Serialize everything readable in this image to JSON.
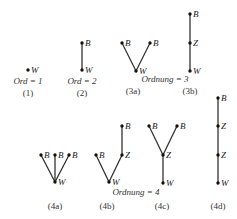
{
  "figure": {
    "labels": {
      "bottom": "B",
      "middle": "Z",
      "top_root": "W"
    },
    "order_labels": [
      {
        "id": "ord1",
        "text": "Ord = 1",
        "x": 28,
        "y": 84
      },
      {
        "id": "ord2",
        "text": "Ord = 2",
        "x": 82,
        "y": 84
      },
      {
        "id": "ord3",
        "text": "Ordnung  = 3",
        "x": 165,
        "y": 82
      },
      {
        "id": "ord4",
        "text": "Ordnung  = 4",
        "x": 136,
        "y": 195
      }
    ],
    "captions": [
      {
        "id": "c1",
        "text": "(1)",
        "x": 28,
        "y": 96
      },
      {
        "id": "c2",
        "text": "(2)",
        "x": 82,
        "y": 96
      },
      {
        "id": "c3a",
        "text": "(3a)",
        "x": 133,
        "y": 94
      },
      {
        "id": "c3b",
        "text": "(3b)",
        "x": 190,
        "y": 94
      },
      {
        "id": "c4a",
        "text": "(4a)",
        "x": 55,
        "y": 209
      },
      {
        "id": "c4b",
        "text": "(4b)",
        "x": 107,
        "y": 209
      },
      {
        "id": "c4c",
        "text": "(4c)",
        "x": 162,
        "y": 209
      },
      {
        "id": "c4d",
        "text": "(4d)",
        "x": 218,
        "y": 209
      }
    ],
    "trees": [
      {
        "id": "tree-1",
        "nodes": [
          {
            "x": 28,
            "y": 70,
            "label": "W"
          }
        ],
        "edges": []
      },
      {
        "id": "tree-2",
        "nodes": [
          {
            "x": 82,
            "y": 43,
            "label": "B"
          },
          {
            "x": 82,
            "y": 70,
            "label": "W"
          }
        ],
        "edges": [
          [
            0,
            1
          ]
        ]
      },
      {
        "id": "tree-3a",
        "nodes": [
          {
            "x": 122,
            "y": 43,
            "label": "B"
          },
          {
            "x": 150,
            "y": 43,
            "label": "B"
          },
          {
            "x": 136,
            "y": 71,
            "label": "W"
          }
        ],
        "edges": [
          [
            0,
            2
          ],
          [
            1,
            2
          ]
        ]
      },
      {
        "id": "tree-3b",
        "nodes": [
          {
            "x": 190,
            "y": 14,
            "label": "B"
          },
          {
            "x": 190,
            "y": 43,
            "label": "Z"
          },
          {
            "x": 190,
            "y": 71,
            "label": "W"
          }
        ],
        "edges": [
          [
            0,
            1
          ],
          [
            1,
            2
          ]
        ]
      },
      {
        "id": "tree-4a",
        "nodes": [
          {
            "x": 41,
            "y": 155,
            "label": "B"
          },
          {
            "x": 55,
            "y": 155,
            "label": "B"
          },
          {
            "x": 69,
            "y": 155,
            "label": "B"
          },
          {
            "x": 55,
            "y": 182,
            "label": "W"
          }
        ],
        "edges": [
          [
            0,
            3
          ],
          [
            1,
            3
          ],
          [
            2,
            3
          ]
        ]
      },
      {
        "id": "tree-4b",
        "nodes": [
          {
            "x": 96,
            "y": 155,
            "label": "B"
          },
          {
            "x": 122,
            "y": 126,
            "label": "B"
          },
          {
            "x": 122,
            "y": 155,
            "label": "Z"
          },
          {
            "x": 109,
            "y": 182,
            "label": "W"
          }
        ],
        "edges": [
          [
            0,
            3
          ],
          [
            1,
            2
          ],
          [
            2,
            3
          ]
        ]
      },
      {
        "id": "tree-4c",
        "nodes": [
          {
            "x": 149,
            "y": 126,
            "label": "B"
          },
          {
            "x": 177,
            "y": 126,
            "label": "B"
          },
          {
            "x": 163,
            "y": 155,
            "label": "Z"
          },
          {
            "x": 163,
            "y": 183,
            "label": "W"
          }
        ],
        "edges": [
          [
            0,
            2
          ],
          [
            1,
            2
          ],
          [
            2,
            3
          ]
        ]
      },
      {
        "id": "tree-4d",
        "nodes": [
          {
            "x": 218,
            "y": 98,
            "label": "B"
          },
          {
            "x": 218,
            "y": 126,
            "label": "Z"
          },
          {
            "x": 218,
            "y": 155,
            "label": "Z"
          },
          {
            "x": 218,
            "y": 183,
            "label": "W"
          }
        ],
        "edges": [
          [
            0,
            1
          ],
          [
            1,
            2
          ],
          [
            2,
            3
          ]
        ]
      }
    ]
  }
}
